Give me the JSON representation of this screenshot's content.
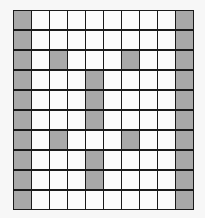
{
  "grid": {
    "rows": 10,
    "cols": 10,
    "colors": {
      "shaded": "#a9a9a9",
      "empty": "#fbfbfb",
      "line": "#1a1a1a"
    },
    "shaded_cells": [
      [
        0,
        0
      ],
      [
        0,
        9
      ],
      [
        1,
        0
      ],
      [
        1,
        9
      ],
      [
        2,
        0
      ],
      [
        2,
        2
      ],
      [
        2,
        6
      ],
      [
        2,
        9
      ],
      [
        3,
        0
      ],
      [
        3,
        4
      ],
      [
        3,
        9
      ],
      [
        4,
        0
      ],
      [
        4,
        4
      ],
      [
        4,
        9
      ],
      [
        5,
        0
      ],
      [
        5,
        4
      ],
      [
        5,
        9
      ],
      [
        6,
        0
      ],
      [
        6,
        2
      ],
      [
        6,
        6
      ],
      [
        6,
        9
      ],
      [
        7,
        0
      ],
      [
        7,
        4
      ],
      [
        7,
        9
      ],
      [
        8,
        0
      ],
      [
        8,
        4
      ],
      [
        8,
        9
      ],
      [
        9,
        0
      ],
      [
        9,
        9
      ]
    ]
  }
}
